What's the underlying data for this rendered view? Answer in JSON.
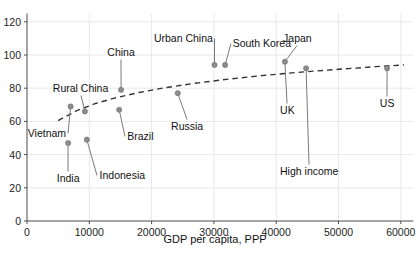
{
  "chart_data": {
    "type": "scatter",
    "title": "",
    "xlabel": "GDP per capita, PPP",
    "ylabel": "",
    "xlim": [
      0,
      62000
    ],
    "ylim": [
      0,
      125
    ],
    "xticks": [
      0,
      10000,
      20000,
      30000,
      40000,
      50000,
      60000
    ],
    "xtick_labels": [
      "0",
      "10000",
      "20000",
      "30000",
      "40000",
      "50000",
      "60000"
    ],
    "yticks": [
      0,
      20,
      40,
      60,
      80,
      100,
      120
    ],
    "ytick_labels": [
      "0",
      "20",
      "40",
      "60",
      "80",
      "100",
      "120"
    ],
    "grid": true,
    "legend": "none",
    "point_color": "#8c8c8c",
    "trend_color": "#333333",
    "trend_style": "dashed",
    "points": [
      {
        "name": "India",
        "x": 6600,
        "y": 47
      },
      {
        "name": "Vietnam",
        "x": 7000,
        "y": 69
      },
      {
        "name": "Rural China",
        "x": 9300,
        "y": 66
      },
      {
        "name": "Indonesia",
        "x": 9600,
        "y": 49
      },
      {
        "name": "Brazil",
        "x": 14800,
        "y": 67
      },
      {
        "name": "China",
        "x": 15100,
        "y": 79
      },
      {
        "name": "Russia",
        "x": 24200,
        "y": 77
      },
      {
        "name": "Urban China",
        "x": 30100,
        "y": 94
      },
      {
        "name": "South Korea",
        "x": 31800,
        "y": 94
      },
      {
        "name": "Japan",
        "x": 41400,
        "y": 96
      },
      {
        "name": "High income",
        "x": 44800,
        "y": 92
      },
      {
        "name": "US",
        "x": 57800,
        "y": 92
      }
    ],
    "annotations": [
      {
        "text": "India",
        "x": 6600,
        "y": 29,
        "align": "center"
      },
      {
        "text": "Vietnam",
        "x": 3200,
        "y": 56,
        "align": "center"
      },
      {
        "text": "Rural China",
        "x": 8600,
        "y": 83,
        "align": "center"
      },
      {
        "text": "Indonesia",
        "x": 15300,
        "y": 31,
        "align": "center"
      },
      {
        "text": "Brazil",
        "x": 18200,
        "y": 54,
        "align": "center"
      },
      {
        "text": "China",
        "x": 15100,
        "y": 105,
        "align": "center"
      },
      {
        "text": "Russia",
        "x": 25700,
        "y": 60,
        "align": "center"
      },
      {
        "text": "Urban China",
        "x": 25100,
        "y": 113,
        "align": "center"
      },
      {
        "text": "South Korea",
        "x": 37700,
        "y": 110,
        "align": "center"
      },
      {
        "text": "Japan",
        "x": 43400,
        "y": 113,
        "align": "center"
      },
      {
        "text": "UK",
        "x": 41800,
        "y": 70,
        "align": "center"
      },
      {
        "text": "High income",
        "x": 45300,
        "y": 33,
        "align": "center"
      },
      {
        "text": "US",
        "x": 57800,
        "y": 74,
        "align": "center"
      }
    ],
    "trend_line": [
      {
        "x": 5000,
        "y": 60.5
      },
      {
        "x": 8000,
        "y": 66.5
      },
      {
        "x": 11000,
        "y": 70.8
      },
      {
        "x": 14000,
        "y": 74.0
      },
      {
        "x": 18000,
        "y": 77.4
      },
      {
        "x": 22000,
        "y": 80.2
      },
      {
        "x": 27000,
        "y": 83.0
      },
      {
        "x": 32000,
        "y": 85.3
      },
      {
        "x": 38000,
        "y": 87.7
      },
      {
        "x": 44000,
        "y": 89.7
      },
      {
        "x": 50000,
        "y": 91.4
      },
      {
        "x": 56000,
        "y": 93.0
      },
      {
        "x": 60500,
        "y": 94.0
      }
    ]
  }
}
